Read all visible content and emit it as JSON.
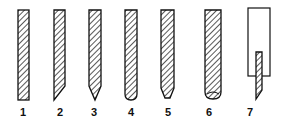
{
  "figure": {
    "items": [
      {
        "label": "1",
        "tip": "flat"
      },
      {
        "label": "2",
        "tip": "single-bevel"
      },
      {
        "label": "3",
        "tip": "conical-point"
      },
      {
        "label": "4",
        "tip": "rounded"
      },
      {
        "label": "5",
        "tip": "truncated-cone"
      },
      {
        "label": "6",
        "tip": "rounded-wide"
      },
      {
        "label": "7",
        "tip": "bevel-in-holder"
      }
    ],
    "colors": {
      "line": "#111111",
      "background": "#ffffff"
    }
  }
}
